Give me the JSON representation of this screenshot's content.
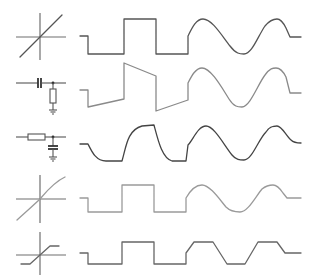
{
  "diagram": {
    "title": "",
    "rows": [
      {
        "id": "linear",
        "symbol": "linear-transfer-characteristic-icon",
        "response": "undistorted square wave followed by undistorted sine wave",
        "color": "#555555"
      },
      {
        "id": "cr-highpass",
        "symbol": "cr-circuit-icon",
        "response": "square wave with tilted (drooping) tops and bottoms, slightly phase-shifted sine",
        "color": "#8a8a8a"
      },
      {
        "id": "rc-lowpass",
        "symbol": "rc-circuit-icon",
        "response": "square wave with rounded exponential edges, attenuated lagging sine",
        "color": "#444444"
      },
      {
        "id": "soft-nonlinear",
        "symbol": "curved-transfer-characteristic-icon",
        "response": "square wave unchanged, sine slightly flattened at peaks",
        "color": "#9a9a9a"
      },
      {
        "id": "hard-limiter",
        "symbol": "clipping-transfer-characteristic-icon",
        "response": "square wave unchanged, sine clipped into trapezoidal shape",
        "color": "#666666"
      }
    ]
  }
}
